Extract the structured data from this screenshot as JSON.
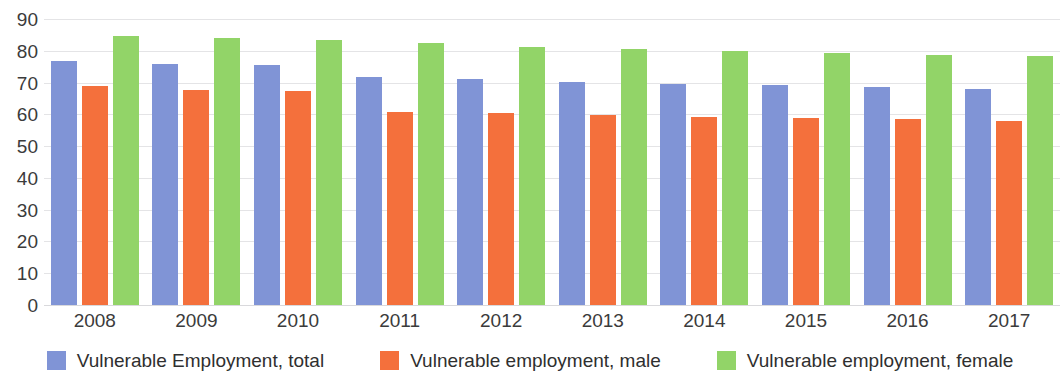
{
  "chart_data": {
    "type": "bar",
    "title": "",
    "subtitle": "",
    "xlabel": "",
    "ylabel": "",
    "categories": [
      "2008",
      "2009",
      "2010",
      "2011",
      "2012",
      "2013",
      "2014",
      "2015",
      "2016",
      "2017"
    ],
    "series": [
      {
        "name": "Vulnerable Employment, total",
        "color": "#8094d6",
        "values": [
          76.8,
          75.8,
          75.5,
          71.8,
          71.2,
          70.3,
          69.6,
          69.3,
          68.6,
          68.0
        ]
      },
      {
        "name": "Vulnerable employment, male",
        "color": "#f4703c",
        "values": [
          68.8,
          67.8,
          67.5,
          60.8,
          60.5,
          59.7,
          59.2,
          59.0,
          58.6,
          58.0
        ]
      },
      {
        "name": "Vulnerable employment, female",
        "color": "#92d468",
        "values": [
          84.7,
          83.9,
          83.5,
          82.3,
          81.2,
          80.6,
          80.0,
          79.4,
          78.8,
          78.3
        ]
      }
    ],
    "ylim": [
      0,
      90
    ],
    "yticks": [
      "90",
      "80",
      "70",
      "60",
      "50",
      "40",
      "30",
      "20",
      "10",
      "0"
    ],
    "ytick_values": [
      90,
      80,
      70,
      60,
      50,
      40,
      30,
      20,
      10,
      0
    ],
    "grid": true,
    "grid_axis": "y",
    "legend_position": "bottom",
    "bar_gap_px": 5
  },
  "legend": {
    "items": [
      {
        "label": "Vulnerable Employment, total",
        "color": "#8094d6"
      },
      {
        "label": "Vulnerable employment, male",
        "color": "#f4703c"
      },
      {
        "label": "Vulnerable employment, female",
        "color": "#92d468"
      }
    ]
  },
  "colors": {
    "total": "#8094d6",
    "male": "#f4703c",
    "female": "#92d468",
    "gridline": "#e4e4e6",
    "text": "#3b3b3b",
    "background": "#ffffff"
  }
}
